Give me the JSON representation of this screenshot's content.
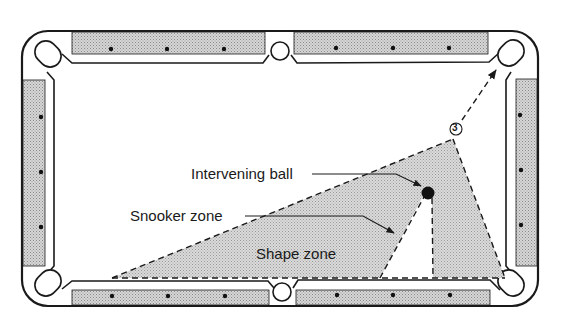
{
  "figure": {
    "type": "pool-table-diagram",
    "labels": {
      "intervening_ball": "Intervening ball",
      "snooker_zone": "Snooker zone",
      "shape_zone": "Shape zone",
      "ball_number": "3"
    },
    "colors": {
      "ink": "#1a1a1a",
      "rail_fill": "#c4c4c4",
      "zone_fill": "#cfcfcf",
      "cloth": "#ffffff"
    },
    "diamonds_per_long_rail_segment": 3,
    "diamonds_per_short_rail": 3
  }
}
